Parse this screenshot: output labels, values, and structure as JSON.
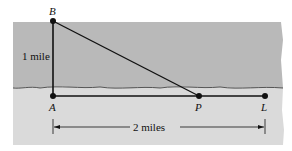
{
  "diagram": {
    "points": {
      "B": {
        "label": "B",
        "x": 53,
        "y": 21
      },
      "A": {
        "label": "A",
        "x": 53,
        "y": 96
      },
      "P": {
        "label": "P",
        "x": 199,
        "y": 96
      },
      "L": {
        "label": "L",
        "x": 265,
        "y": 96
      }
    },
    "labels": {
      "vertical_distance": "1 mile",
      "horizontal_distance": "2 miles"
    },
    "colors": {
      "water": "#b9b9b9",
      "land": "#dadada",
      "line": "#111111"
    }
  }
}
